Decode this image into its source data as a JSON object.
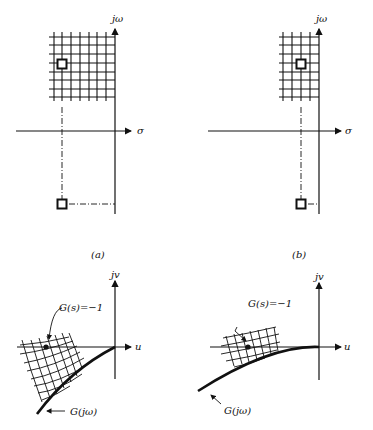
{
  "figure": {
    "panel_a": {
      "caption": "(a)",
      "s_plane": {
        "vertical_axis_label": "jω",
        "horizontal_axis_label": "σ"
      },
      "w_plane": {
        "vertical_axis_label": "jv",
        "horizontal_axis_label": "u",
        "point_label": "G(s)=−1",
        "curve_label": "G(jω)"
      }
    },
    "panel_b": {
      "caption": "(b)",
      "s_plane": {
        "vertical_axis_label": "jω",
        "horizontal_axis_label": "σ"
      },
      "w_plane": {
        "vertical_axis_label": "jv",
        "horizontal_axis_label": "u",
        "point_label": "G(s)=−1",
        "curve_label": "G(jω)"
      }
    },
    "colors": {
      "ink": "#111111",
      "background": "#ffffff"
    }
  }
}
